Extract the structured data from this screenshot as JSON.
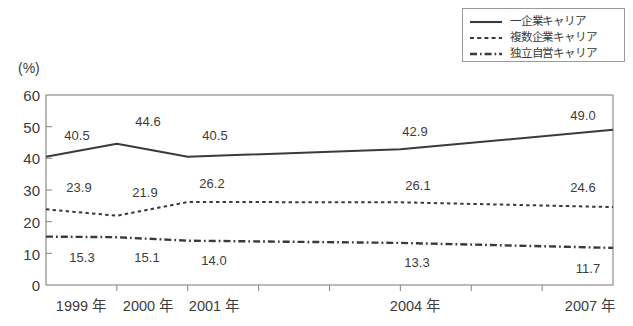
{
  "chart_data": {
    "type": "line",
    "title": "",
    "xlabel": "",
    "ylabel": "(%)",
    "ylim": [
      0,
      60
    ],
    "yticks": [
      0,
      10,
      20,
      30,
      40,
      50,
      60
    ],
    "grid": false,
    "legend_position": "top-right",
    "x": [
      "1999",
      "2000",
      "2001",
      "2004",
      "2007"
    ],
    "categories": [
      "1999年",
      "2000年",
      "2001年",
      "2004年",
      "2007年"
    ],
    "axis_tick_years": [
      "1999",
      "2000",
      "2001",
      "2002",
      "2003",
      "2004",
      "2005",
      "2006",
      "2007"
    ],
    "series": [
      {
        "name": "一企業キャリア",
        "style": "solid",
        "values": [
          40.5,
          44.6,
          40.5,
          42.9,
          49.0
        ],
        "labels": [
          "40.5",
          "44.6",
          "40.5",
          "42.9",
          "49.0"
        ]
      },
      {
        "name": "複数企業キャリア",
        "style": "dotted",
        "values": [
          23.9,
          21.9,
          26.2,
          26.1,
          24.6
        ],
        "labels": [
          "23.9",
          "21.9",
          "26.2",
          "26.1",
          "24.6"
        ]
      },
      {
        "name": "独立自営キャリア",
        "style": "dash-dot",
        "values": [
          15.3,
          15.1,
          14.0,
          13.3,
          11.7
        ],
        "labels": [
          "15.3",
          "15.1",
          "14.0",
          "13.3",
          "11.7"
        ]
      }
    ]
  },
  "axes": {
    "unit_label": "(%)",
    "ytick_labels": [
      "60",
      "50",
      "40",
      "30",
      "20",
      "10",
      "0"
    ],
    "xtick_labels": [
      "1999 年",
      "2000 年",
      "2001 年",
      "2004 年",
      "2007 年"
    ]
  },
  "legend": {
    "items": [
      {
        "label": "一企業キャリア",
        "style": "solid"
      },
      {
        "label": "複数企業キャリア",
        "style": "dotted"
      },
      {
        "label": "独立自営キャリア",
        "style": "dash-dot"
      }
    ]
  },
  "data_labels": {
    "series1": [
      "40.5",
      "44.6",
      "40.5",
      "42.9",
      "49.0"
    ],
    "series2": [
      "23.9",
      "21.9",
      "26.2",
      "26.1",
      "24.6"
    ],
    "series3": [
      "15.3",
      "15.1",
      "14.0",
      "13.3",
      "11.7"
    ]
  },
  "colors": {
    "line": "#3a3a3a",
    "axis": "#8d8d8d",
    "text": "#3c3c3c",
    "background": "#ffffff"
  }
}
